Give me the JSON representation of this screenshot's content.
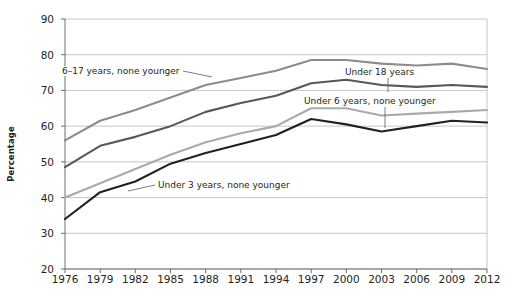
{
  "chart_data": {
    "type": "line",
    "title": "",
    "xlabel": "",
    "ylabel": "Percentage",
    "xlim": [
      1976,
      2012
    ],
    "ylim": [
      20,
      90
    ],
    "yticks": [
      90,
      80,
      70,
      60,
      50,
      40,
      30,
      20
    ],
    "grid": true,
    "legend_position": "inline-annotations",
    "x": [
      1976,
      1979,
      1982,
      1985,
      1988,
      1991,
      1994,
      1997,
      2000,
      2003,
      2006,
      2009,
      2012
    ],
    "categories": [
      "1976",
      "1979",
      "1982",
      "1985",
      "1988",
      "1991",
      "1994",
      "1997",
      "2000",
      "2003",
      "2006",
      "2009",
      "2012"
    ],
    "series": [
      {
        "name": "6–17 years, none younger",
        "color": "#8c8c8c",
        "values": [
          56.0,
          61.5,
          64.5,
          68.0,
          71.5,
          73.5,
          75.5,
          78.5,
          78.5,
          77.5,
          77.0,
          77.5,
          76.0
        ]
      },
      {
        "name": "Under 18 years",
        "color": "#58585b",
        "values": [
          48.5,
          54.5,
          57.0,
          60.0,
          64.0,
          66.5,
          68.5,
          72.0,
          73.0,
          71.5,
          71.0,
          71.5,
          71.0
        ]
      },
      {
        "name": "Under 6 years, none younger",
        "color": "#aaaaaa",
        "values": [
          40.0,
          44.0,
          48.0,
          52.0,
          55.5,
          58.0,
          60.0,
          65.0,
          65.0,
          63.0,
          63.5,
          64.0,
          64.5
        ]
      },
      {
        "name": "Under 3 years, none younger",
        "color": "#231f20",
        "values": [
          34.0,
          41.5,
          44.5,
          49.5,
          52.5,
          55.0,
          57.5,
          62.0,
          60.5,
          58.5,
          60.0,
          61.5,
          61.0
        ]
      }
    ],
    "annotations": [
      {
        "text": "6–17 years, none younger",
        "x_px": 60,
        "y_px": 66,
        "leader": {
          "x1": 183,
          "y1": 71,
          "x2": 212,
          "y2": 77
        }
      },
      {
        "text": "Under 18 years",
        "x_px": 343,
        "y_px": 67,
        "leader": {
          "x1": 388,
          "y1": 78,
          "x2": 388,
          "y2": 92
        }
      },
      {
        "text": "Under 6 years, none younger",
        "x_px": 302,
        "y_px": 96,
        "leader": {
          "x1": 385,
          "y1": 107,
          "x2": 385,
          "y2": 128
        }
      },
      {
        "text": "Under 3 years, none younger",
        "x_px": 156,
        "y_px": 180,
        "leader": {
          "x1": 128,
          "y1": 191,
          "x2": 155,
          "y2": 185
        }
      }
    ]
  }
}
